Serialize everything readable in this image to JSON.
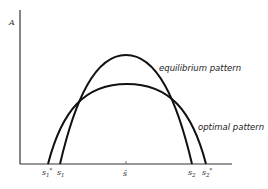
{
  "diagram": {
    "y_axis_label": "A",
    "curves": [
      {
        "name": "equilibrium",
        "label": "equilibrium pattern",
        "left_root_label": "s1",
        "right_root_label": "s2",
        "peak": "tall, narrow"
      },
      {
        "name": "optimal",
        "label": "optimal pattern",
        "left_root_label": "s1*",
        "right_root_label": "s2*",
        "peak": "lower, wider"
      }
    ],
    "x_ticks": [
      {
        "id": "s1_star",
        "base": "s",
        "sub": "1",
        "sup": "*"
      },
      {
        "id": "s1",
        "base": "s",
        "sub": "1",
        "sup": ""
      },
      {
        "id": "s_bar",
        "base": "s̄",
        "sub": "",
        "sup": ""
      },
      {
        "id": "s2",
        "base": "s",
        "sub": "2",
        "sup": ""
      },
      {
        "id": "s2_star",
        "base": "s",
        "sub": "2",
        "sup": "*"
      }
    ],
    "colors": {
      "curve": "#111111",
      "axis": "#333333",
      "text": "#222222",
      "background": "#ffffff"
    }
  }
}
